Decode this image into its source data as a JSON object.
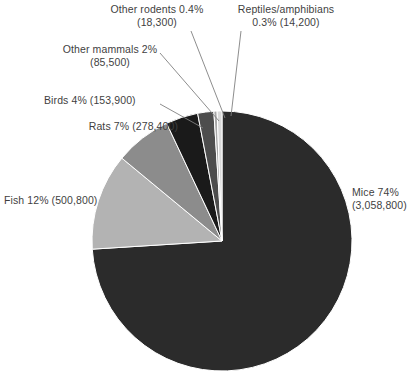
{
  "chart_data": {
    "type": "pie",
    "title": "",
    "subtitle": "",
    "xlabel": "",
    "ylabel": "",
    "legend_position": "none",
    "grid": false,
    "labels_outside": true,
    "total": 4109900,
    "categories": [
      "Mice",
      "Fish",
      "Rats",
      "Birds",
      "Other mammals",
      "Other rodents",
      "Reptiles/amphibians"
    ],
    "values": [
      3058800,
      500800,
      278400,
      153900,
      85500,
      18300,
      14200
    ],
    "percents": [
      74,
      12,
      7,
      4,
      2,
      0.4,
      0.3
    ],
    "colors": [
      "#2b2b2b",
      "#b3b3b3",
      "#8c8c8c",
      "#1a1a1a",
      "#4d4d4d",
      "#a6a6a6",
      "#d9d9d9"
    ],
    "slices": [
      {
        "name": "Mice",
        "label": "Mice 74%",
        "label_line2": "(3,058,800)",
        "percent": 74,
        "percent_text": "74%",
        "value": 3058800,
        "value_text": "(3,058,800)",
        "color": "#2b2b2b",
        "start_angle": 0,
        "end_angle": 266.4
      },
      {
        "name": "Fish",
        "label": "Fish 12% (500,800)",
        "percent": 12,
        "percent_text": "12%",
        "value": 500800,
        "value_text": "(500,800)",
        "color": "#b3b3b3",
        "start_angle": 266.4,
        "end_angle": 309.6
      },
      {
        "name": "Rats",
        "label": "Rats 7% (278,400)",
        "percent": 7,
        "percent_text": "7%",
        "value": 278400,
        "value_text": "(278,400)",
        "color": "#8c8c8c",
        "start_angle": 309.6,
        "end_angle": 334.8
      },
      {
        "name": "Birds",
        "label": "Birds 4% (153,900)",
        "percent": 4,
        "percent_text": "4%",
        "value": 153900,
        "value_text": "(153,900)",
        "color": "#1a1a1a",
        "start_angle": 334.8,
        "end_angle": 349.2
      },
      {
        "name": "Other mammals",
        "label": "Other mammals 2%",
        "label_line2": "(85,500)",
        "percent": 2,
        "percent_text": "2%",
        "value": 85500,
        "value_text": "(85,500)",
        "color": "#4d4d4d",
        "start_angle": 349.2,
        "end_angle": 356.4
      },
      {
        "name": "Other rodents",
        "label": "Other rodents 0.4%",
        "label_line2": "(18,300)",
        "percent": 0.4,
        "percent_text": "0.4%",
        "value": 18300,
        "value_text": "(18,300)",
        "color": "#a6a6a6",
        "start_angle": 356.4,
        "end_angle": 357.84
      },
      {
        "name": "Reptiles/amphibians",
        "label": "Reptiles/amphibians",
        "label_line2": "0.3% (14,200)",
        "percent": 0.3,
        "percent_text": "0.3%",
        "value": 14200,
        "value_text": "(14,200)",
        "color": "#d9d9d9",
        "start_angle": 357.84,
        "end_angle": 360
      }
    ]
  },
  "labels": {
    "other_rodents_line1": "Other rodents 0.4%",
    "other_rodents_line2": "(18,300)",
    "reptiles_line1": "Reptiles/amphibians",
    "reptiles_line2": "0.3% (14,200)",
    "other_mammals_line1": "Other mammals 2%",
    "other_mammals_line2": "(85,500)",
    "birds": "Birds 4% (153,900)",
    "rats": "Rats 7% (278,400)",
    "fish": "Fish 12% (500,800)",
    "mice_line1": "Mice 74%",
    "mice_line2": "(3,058,800)"
  }
}
